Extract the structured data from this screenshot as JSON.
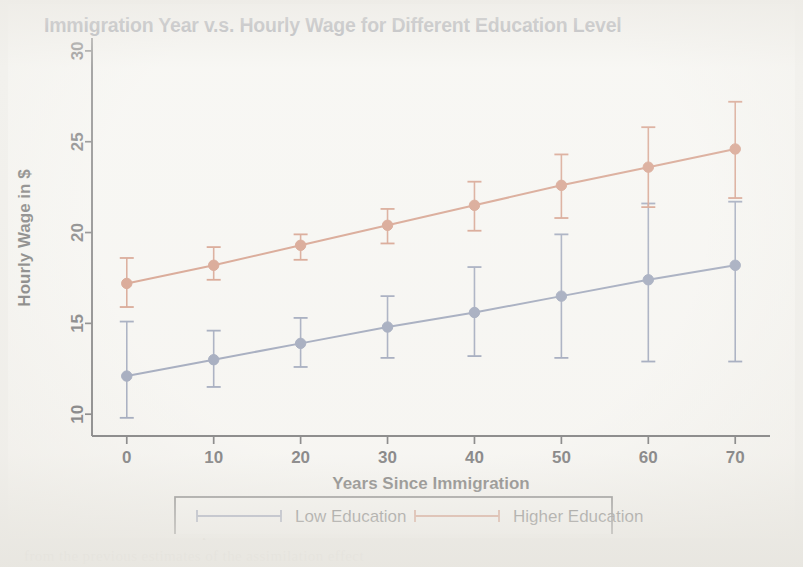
{
  "figure": {
    "background_color": "#fdfdfb",
    "page_color": "#efeeea"
  },
  "chart_data": {
    "type": "line",
    "title": "Immigration Year v.s. Hourly Wage for Different Education Level",
    "xlabel": "Years Since Immigration",
    "ylabel": "Hourly Wage in $",
    "x": [
      0,
      10,
      20,
      30,
      40,
      50,
      60,
      70
    ],
    "xticks": [
      "0",
      "10",
      "20",
      "30",
      "40",
      "50",
      "60",
      "70"
    ],
    "yticks": [
      "10",
      "15",
      "20",
      "25",
      "30"
    ],
    "xlim": [
      -4,
      74
    ],
    "ylim": [
      8.8,
      30.6
    ],
    "grid": false,
    "legend_position": "bottom-center",
    "error_bars": true,
    "series": [
      {
        "name": "Low Education",
        "color": "#5a6a94",
        "marker": "circle",
        "values": [
          12.1,
          13.0,
          13.9,
          14.8,
          15.6,
          16.5,
          17.4,
          18.2
        ],
        "err_low": [
          9.8,
          11.5,
          12.6,
          13.1,
          13.2,
          13.1,
          12.9,
          12.9
        ],
        "err_high": [
          15.1,
          14.6,
          15.3,
          16.5,
          18.1,
          19.9,
          21.6,
          21.7
        ]
      },
      {
        "name": "Higher Education",
        "color": "#bf5b3a",
        "marker": "circle",
        "values": [
          17.2,
          18.2,
          19.3,
          20.4,
          21.5,
          22.6,
          23.6,
          24.6
        ],
        "err_low": [
          15.9,
          17.4,
          18.5,
          19.4,
          20.1,
          20.8,
          21.4,
          21.9
        ],
        "err_high": [
          18.6,
          19.2,
          19.9,
          21.3,
          22.8,
          24.3,
          25.8,
          27.2
        ]
      }
    ]
  },
  "legend": {
    "items": [
      {
        "label": "Low Education",
        "color": "#5a6a94"
      },
      {
        "label": "Higher Education",
        "color": "#bf5b3a"
      }
    ]
  },
  "scan_bleed": {
    "lines": [
      "that there is a negative effect for the immigration arrival  in",
      "age on arrival is more important to immigrants than one  does",
      "coworkers and that  it  is  not possible  to  isolate  that",
      "from  the  previous  estimates  of  the  assimilation  effect"
    ]
  }
}
